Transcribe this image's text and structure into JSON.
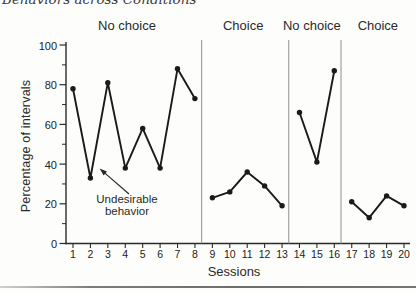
{
  "page": {
    "caption_fragment": "Behaviors across Conditions",
    "background_color": "#fdfdfb",
    "rule_color": "#6f6f6f"
  },
  "chart_data": {
    "type": "line",
    "title": "",
    "xlabel": "Sessions",
    "ylabel": "Percentage of intervals",
    "x": [
      1,
      2,
      3,
      4,
      5,
      6,
      7,
      8,
      9,
      10,
      11,
      12,
      13,
      14,
      15,
      16,
      17,
      18,
      19,
      20
    ],
    "ylim": [
      0,
      100
    ],
    "y_major_ticks": [
      0,
      20,
      40,
      60,
      80,
      100
    ],
    "y_minor_ticks": [
      10,
      30,
      50,
      70,
      90
    ],
    "grid": "off",
    "legend": "none",
    "marker": "filled-circle",
    "line_color": "#1a1a1a",
    "axis_color": "#2a2a2a",
    "separator_color": "#8f8f8f",
    "phases": [
      {
        "label": "No choice",
        "sessions": [
          1,
          2,
          3,
          4,
          5,
          6,
          7,
          8
        ],
        "values": [
          78,
          33,
          81,
          38,
          58,
          38,
          88,
          73
        ]
      },
      {
        "label": "Choice",
        "sessions": [
          9,
          10,
          11,
          12,
          13
        ],
        "values": [
          23,
          26,
          36,
          29,
          19
        ]
      },
      {
        "label": "No choice",
        "sessions": [
          14,
          15,
          16
        ],
        "values": [
          66,
          41,
          87
        ]
      },
      {
        "label": "Choice",
        "sessions": [
          17,
          18,
          19,
          20
        ],
        "values": [
          21,
          13,
          24,
          19
        ]
      }
    ],
    "annotation": {
      "lines": [
        "Undesirable",
        "behavior"
      ],
      "target": "data point at session 2"
    }
  }
}
